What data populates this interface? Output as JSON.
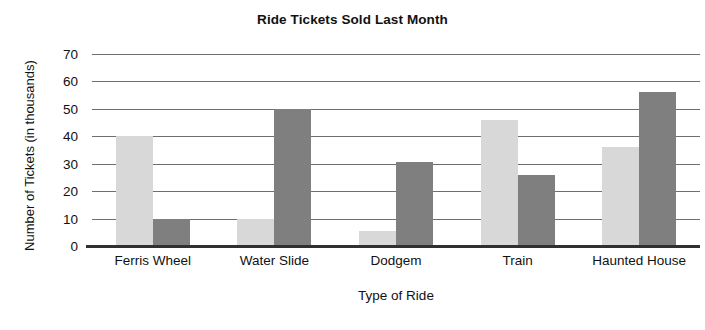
{
  "chart_data": {
    "type": "bar",
    "title": "Ride Tickets Sold Last Month",
    "xlabel": "Type of Ride",
    "ylabel": "Number of Tickets (in thousands)",
    "categories": [
      "Ferris Wheel",
      "Water Slide",
      "Dodgem",
      "Train",
      "Haunted House"
    ],
    "series": [
      {
        "name": "light-series",
        "color": "#d8d8d8",
        "values": [
          40,
          10,
          5.5,
          46,
          36
        ]
      },
      {
        "name": "dark-series",
        "color": "#7f7f7f",
        "values": [
          10,
          50,
          30.5,
          26,
          56
        ]
      }
    ],
    "ylim": [
      0,
      70
    ],
    "ytick_labels": [
      "70",
      "60",
      "50",
      "40",
      "30",
      "20",
      "10",
      "0"
    ],
    "ytick_values": [
      70,
      60,
      50,
      40,
      30,
      20,
      10,
      0
    ],
    "grid": true,
    "legend": "none",
    "axis_color": "#303030",
    "gridline_color": "#6e6e6e"
  }
}
